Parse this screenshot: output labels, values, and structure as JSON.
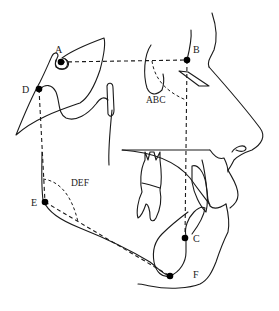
{
  "figure": {
    "type": "cephalometric lateral tracing",
    "points": [
      {
        "id": "A",
        "label": "A",
        "x": 61,
        "y": 62
      },
      {
        "id": "B",
        "label": "B",
        "x": 187,
        "y": 60
      },
      {
        "id": "C",
        "label": "C",
        "x": 185,
        "y": 238
      },
      {
        "id": "D",
        "label": "D",
        "x": 39,
        "y": 89
      },
      {
        "id": "E",
        "label": "E",
        "x": 45,
        "y": 202
      },
      {
        "id": "F",
        "label": "F",
        "x": 170,
        "y": 276
      }
    ],
    "angles": [
      {
        "id": "ABC",
        "label": "ABC"
      },
      {
        "id": "DEF",
        "label": "DEF"
      }
    ],
    "colors": {
      "line": "#1a1a1a",
      "point": "#000000",
      "background": "#ffffff"
    }
  },
  "labels": {
    "A": "A",
    "B": "B",
    "C": "C",
    "D": "D",
    "E": "E",
    "F": "F",
    "ABC": "ABC",
    "DEF": "DEF"
  }
}
